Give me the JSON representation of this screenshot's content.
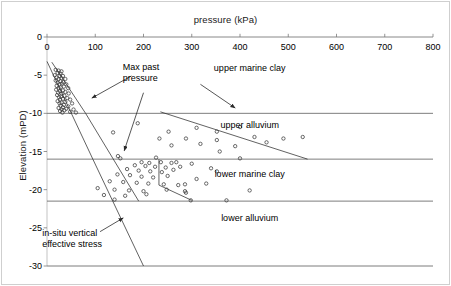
{
  "figure": {
    "width": 451,
    "height": 286,
    "background": "#ffffff",
    "border_color": "#cfcfcf"
  },
  "chart_data": {
    "type": "scatter",
    "title": "",
    "xlabel": "pressure (kPa)",
    "ylabel": "Elevation (mPD)",
    "xlim": [
      0,
      800
    ],
    "ylim": [
      -30,
      0
    ],
    "xticks": [
      0,
      100,
      200,
      300,
      400,
      500,
      600,
      700,
      800
    ],
    "xtick_labels": [
      "0",
      "100",
      "200",
      "300",
      "400",
      "500",
      "600",
      "700",
      "800"
    ],
    "yticks": [
      0,
      -5,
      -10,
      -15,
      -20,
      -25,
      -30
    ],
    "ytick_labels": [
      "0",
      "-5",
      "-10",
      "-15",
      "-20",
      "-25",
      "-30"
    ],
    "grid": false,
    "xaxis_position": "top",
    "legend": "none",
    "marker": {
      "shape": "circle",
      "filled": false,
      "edge_color": "#3a3a3a",
      "size_px": 3.2
    },
    "series": [
      {
        "name": "max past pressure",
        "points": [
          [
            18,
            -4.3
          ],
          [
            24,
            -4.4
          ],
          [
            30,
            -4.5
          ],
          [
            22,
            -4.7
          ],
          [
            28,
            -4.8
          ],
          [
            16,
            -5.0
          ],
          [
            26,
            -5.1
          ],
          [
            33,
            -5.1
          ],
          [
            20,
            -5.3
          ],
          [
            30,
            -5.4
          ],
          [
            24,
            -5.5
          ],
          [
            38,
            -5.5
          ],
          [
            18,
            -5.7
          ],
          [
            28,
            -5.8
          ],
          [
            34,
            -5.9
          ],
          [
            22,
            -6.0
          ],
          [
            31,
            -6.1
          ],
          [
            26,
            -6.2
          ],
          [
            40,
            -6.2
          ],
          [
            20,
            -6.4
          ],
          [
            35,
            -6.5
          ],
          [
            28,
            -6.6
          ],
          [
            24,
            -6.7
          ],
          [
            44,
            -6.7
          ],
          [
            19,
            -6.9
          ],
          [
            33,
            -7.0
          ],
          [
            27,
            -7.1
          ],
          [
            38,
            -7.2
          ],
          [
            23,
            -7.3
          ],
          [
            30,
            -7.4
          ],
          [
            45,
            -7.4
          ],
          [
            21,
            -7.6
          ],
          [
            36,
            -7.7
          ],
          [
            29,
            -7.8
          ],
          [
            25,
            -7.9
          ],
          [
            42,
            -8.0
          ],
          [
            33,
            -8.1
          ],
          [
            27,
            -8.2
          ],
          [
            48,
            -8.2
          ],
          [
            22,
            -8.4
          ],
          [
            38,
            -8.5
          ],
          [
            30,
            -8.6
          ],
          [
            26,
            -8.7
          ],
          [
            52,
            -8.7
          ],
          [
            35,
            -8.9
          ],
          [
            28,
            -9.0
          ],
          [
            44,
            -9.1
          ],
          [
            33,
            -9.2
          ],
          [
            24,
            -9.3
          ],
          [
            40,
            -9.4
          ],
          [
            30,
            -9.5
          ],
          [
            55,
            -9.5
          ],
          [
            36,
            -9.6
          ],
          [
            27,
            -9.7
          ],
          [
            48,
            -9.8
          ],
          [
            32,
            -9.9
          ],
          [
            60,
            -9.9
          ],
          [
            188,
            -11.3
          ],
          [
            137,
            -12.5
          ],
          [
            252,
            -12.4
          ],
          [
            310,
            -11.9
          ],
          [
            352,
            -12.4
          ],
          [
            400,
            -11.8
          ],
          [
            233,
            -13.3
          ],
          [
            288,
            -13.3
          ],
          [
            352,
            -13.5
          ],
          [
            430,
            -13.1
          ],
          [
            258,
            -14.2
          ],
          [
            318,
            -14.0
          ],
          [
            390,
            -14.3
          ],
          [
            455,
            -13.8
          ],
          [
            490,
            -13.3
          ],
          [
            530,
            -13.1
          ],
          [
            358,
            -15.0
          ],
          [
            226,
            -15.8
          ],
          [
            147,
            -15.6
          ],
          [
            152,
            -15.9
          ],
          [
            400,
            -15.9
          ],
          [
            196,
            -16.4
          ],
          [
            212,
            -16.5
          ],
          [
            236,
            -16.4
          ],
          [
            258,
            -16.5
          ],
          [
            268,
            -16.4
          ],
          [
            182,
            -16.8
          ],
          [
            204,
            -16.9
          ],
          [
            224,
            -17.0
          ],
          [
            246,
            -17.1
          ],
          [
            276,
            -17.0
          ],
          [
            300,
            -16.6
          ],
          [
            166,
            -17.3
          ],
          [
            190,
            -17.5
          ],
          [
            214,
            -17.6
          ],
          [
            238,
            -17.7
          ],
          [
            262,
            -17.4
          ],
          [
            340,
            -17.2
          ],
          [
            352,
            -17.6
          ],
          [
            146,
            -18.0
          ],
          [
            172,
            -18.1
          ],
          [
            196,
            -18.3
          ],
          [
            220,
            -18.4
          ],
          [
            250,
            -18.2
          ],
          [
            310,
            -18.6
          ],
          [
            130,
            -18.9
          ],
          [
            158,
            -19.0
          ],
          [
            186,
            -19.1
          ],
          [
            210,
            -19.2
          ],
          [
            242,
            -19.3
          ],
          [
            272,
            -19.4
          ],
          [
            286,
            -19.3
          ],
          [
            330,
            -19.2
          ],
          [
            105,
            -19.8
          ],
          [
            140,
            -20.0
          ],
          [
            170,
            -20.1
          ],
          [
            200,
            -20.2
          ],
          [
            248,
            -20.0
          ],
          [
            286,
            -20.2
          ],
          [
            288,
            -20.4
          ],
          [
            420,
            -20.1
          ],
          [
            118,
            -20.7
          ],
          [
            162,
            -20.8
          ],
          [
            206,
            -20.6
          ],
          [
            140,
            -21.3
          ],
          [
            298,
            -21.4
          ],
          [
            372,
            -21.4
          ]
        ]
      }
    ],
    "strata": [
      {
        "name": "upper marine clay",
        "top": 0,
        "bottom": -10,
        "label_x": 420,
        "label_y": -4.2
      },
      {
        "name": "upper alluvium",
        "top": -10,
        "bottom": -16,
        "label_x": 420,
        "label_y": -11.7
      },
      {
        "name": "lower marine clay",
        "top": -16,
        "bottom": -21.5,
        "label_x": 420,
        "label_y": -18.1
      },
      {
        "name": "lower alluvium",
        "top": -21.5,
        "bottom": -30,
        "label_x": 420,
        "label_y": -23.9
      }
    ],
    "strata_boundaries_y": [
      -10,
      -16,
      -21.5,
      -30
    ],
    "lines": [
      {
        "name": "in-situ vertical effective stress",
        "style": "solid",
        "points": [
          [
            0,
            -3.2
          ],
          [
            95,
            -16.0
          ],
          [
            200,
            -30.0
          ]
        ]
      },
      {
        "name": "max past pressure envelope upper",
        "style": "solid",
        "points": [
          [
            10,
            -3.3
          ],
          [
            80,
            -10.0
          ],
          [
            190,
            -21.5
          ]
        ]
      },
      {
        "name": "max past pressure envelope mid",
        "style": "solid",
        "points": [
          [
            235,
            -9.8
          ],
          [
            540,
            -16.0
          ]
        ]
      },
      {
        "name": "max past pressure envelope lower",
        "style": "solid",
        "points": [
          [
            232,
            -16.0
          ],
          [
            232,
            -19.4
          ],
          [
            300,
            -21.4
          ]
        ]
      }
    ],
    "annotations": [
      {
        "name": "max-past-pressure",
        "text_line1": "Max past",
        "text_line2": "pressure",
        "text_x": 195,
        "text_y": -4.0,
        "arrows": [
          {
            "from": [
              175,
              -5.1
            ],
            "to": [
              93,
              -8.0
            ]
          },
          {
            "from": [
              200,
              -7.3
            ],
            "to": [
              160,
              -14.9
            ]
          },
          {
            "from": [
              318,
              -6.2
            ],
            "to": [
              390,
              -9.3
            ]
          }
        ]
      },
      {
        "name": "in-situ-vertical-effective-stress",
        "text_line1": "in-situ vertical",
        "text_line2": "effective stress",
        "text_x": 52,
        "text_y": -25.8,
        "arrows": [
          {
            "from": [
              110,
              -25.5
            ],
            "to": [
              158,
              -23.7
            ]
          }
        ]
      }
    ]
  },
  "style": {
    "axis_line_color": "#7a7a7a",
    "strata_line_color": "#6e6e6e",
    "annotation_line_color": "#2b2b2b",
    "marker_color": "#4a4a4a",
    "text_color": "#1a1a1a"
  }
}
